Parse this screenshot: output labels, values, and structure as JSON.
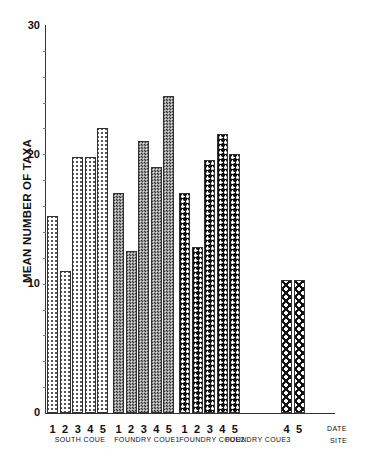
{
  "chart_data": {
    "type": "bar",
    "title": "",
    "xlabel": "SITE / DATE",
    "ylabel": "MEAN NUMBER OF TAXA",
    "ylim": [
      0,
      30
    ],
    "yticks": [
      "0",
      "10",
      "20",
      "30"
    ],
    "grid": false,
    "legend": null,
    "row_labels": {
      "date": "DATE",
      "site": "SITE"
    },
    "groups": [
      {
        "site": "SOUTH COVE",
        "pattern": "fine-lattice",
        "dates": [
          "1",
          "2",
          "3",
          "4",
          "5"
        ],
        "values": [
          15.2,
          11.0,
          19.8,
          19.8,
          22.0
        ]
      },
      {
        "site": "FOUNDRY COVE1",
        "pattern": "dense-dark",
        "dates": [
          "1",
          "2",
          "3",
          "4",
          "5"
        ],
        "values": [
          17.0,
          12.5,
          21.0,
          19.0,
          24.5
        ]
      },
      {
        "site": "FOUNDRY COVE2",
        "pattern": "bold-lattice",
        "dates": [
          "1",
          "2",
          "3",
          "4",
          "5"
        ],
        "values": [
          17.0,
          12.8,
          19.6,
          21.6,
          20.0
        ]
      },
      {
        "site": "FOUNDRY COVE3",
        "pattern": "large-cross",
        "dates": [
          "4",
          "5"
        ],
        "values": [
          10.3,
          10.3
        ]
      }
    ]
  },
  "labels": {
    "ylabel": "MEAN NUMBER OF TAXA",
    "y0": "0",
    "y10": "10",
    "y20": "20",
    "y30": "30",
    "date": "DATE",
    "site": "SITE"
  }
}
